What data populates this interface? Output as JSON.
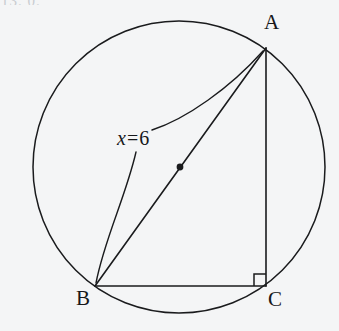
{
  "figure": {
    "type": "circle-inscribed-right-triangle",
    "background_color": "#f4f5f6",
    "stroke_color": "#1a1b1d",
    "page_fragment_text": "13. 0.",
    "labels": {
      "vertex_a": "A",
      "vertex_b": "B",
      "vertex_c": "C",
      "measure_variable": "x",
      "measure_equals": "=",
      "measure_value": "6",
      "measure_full": "x = 6"
    },
    "geometry": {
      "circle": {
        "cx": 179,
        "cy": 167,
        "r": 146
      },
      "center_dot": {
        "cx": 180,
        "cy": 167,
        "r": 3.2
      },
      "points": {
        "A": {
          "x": 266,
          "y": 48
        },
        "B": {
          "x": 95,
          "y": 286
        },
        "C": {
          "x": 266,
          "y": 286
        }
      },
      "segments": [
        {
          "name": "hypotenuse-AB",
          "from": "A",
          "to": "B"
        },
        {
          "name": "leg-AC",
          "from": "A",
          "to": "C"
        },
        {
          "name": "leg-BC",
          "from": "B",
          "to": "C"
        }
      ],
      "right_angle_marker": {
        "at": "C",
        "size": 12
      },
      "leader_lines": [
        {
          "name": "leader-to-A",
          "from": {
            "x": 152,
            "y": 130
          },
          "to": {
            "x": 263,
            "y": 51
          }
        },
        {
          "name": "leader-to-B",
          "from": {
            "x": 136,
            "y": 152
          },
          "to": {
            "x": 96,
            "y": 283
          }
        }
      ]
    }
  }
}
